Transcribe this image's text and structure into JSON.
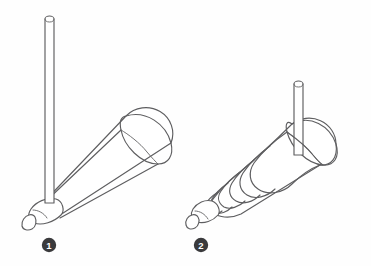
{
  "plate": {
    "width": 371,
    "height": 266,
    "background_color": "#fefefe",
    "line_color": "#5e5e60",
    "fill_color": "#ffffff",
    "badge_color": "#3a3a3c",
    "badge_text_color": "#ffffff",
    "style": "technical line drawing, outline only, no shading"
  },
  "figures": [
    {
      "id": "figure-1",
      "label": "❶",
      "numeral": "1",
      "label_x": 49,
      "label_y": 245,
      "title": "Smooth conical horn with long vertical rod",
      "parts": {
        "rod": {
          "name": "vertical-rod",
          "orientation": "vertical",
          "top_x": 49,
          "top_y": 15,
          "bottom_x": 49,
          "bottom_y": 201,
          "width": 9,
          "cap": "rounded"
        },
        "cone": {
          "name": "smooth-cone",
          "surface": "smooth",
          "tip_x": 36,
          "tip_y": 207,
          "mouth_center_x": 146,
          "mouth_center_y": 140,
          "mouth_width": 52,
          "mouth_height": 50,
          "rib_count": 0
        },
        "nose": {
          "name": "rounded-nose-tip",
          "has_nub": true
        }
      }
    },
    {
      "id": "figure-2",
      "label": "❷",
      "numeral": "2",
      "label_x": 201,
      "label_y": 245,
      "title": "Ribbed corrugated conical horn with short vertical rod",
      "parts": {
        "rod": {
          "name": "vertical-rod",
          "orientation": "vertical",
          "top_x": 298,
          "top_y": 80,
          "bottom_x": 298,
          "bottom_y": 152,
          "width": 9,
          "cap": "rounded"
        },
        "cone": {
          "name": "ribbed-cone",
          "surface": "corrugated",
          "tip_x": 203,
          "tip_y": 213,
          "mouth_center_x": 325,
          "mouth_center_y": 140,
          "mouth_width": 52,
          "mouth_height": 50,
          "rib_count": 6
        },
        "nose": {
          "name": "rounded-nose-tip",
          "has_nub": true
        }
      }
    }
  ]
}
